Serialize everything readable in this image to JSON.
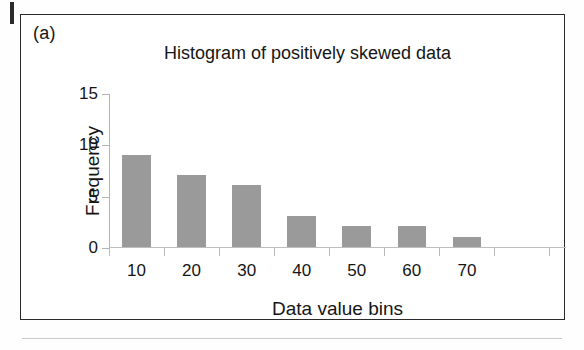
{
  "figure": {
    "panel_label": "(a)",
    "frame_color": "#2a2a2a",
    "background": "#ffffff"
  },
  "chart_data": {
    "type": "bar",
    "title": "Histogram of positively skewed data",
    "xlabel": "Data value bins",
    "ylabel": "Frequency",
    "categories": [
      "10",
      "20",
      "30",
      "40",
      "50",
      "60",
      "70"
    ],
    "values": [
      9,
      7,
      6,
      3,
      2,
      2,
      1
    ],
    "ylim": [
      0,
      15
    ],
    "yticks": [
      0,
      5,
      10,
      15
    ],
    "ytick_labels": [
      "0",
      "5",
      "10",
      "15"
    ],
    "xtick_labels": [
      "10",
      "20",
      "30",
      "40",
      "50",
      "60",
      "70"
    ],
    "extra_unlabeled_xticks": 1,
    "grid": false,
    "legend": false,
    "bar_color": "#9a9a9a",
    "axis_color": "#b9b9b9"
  }
}
